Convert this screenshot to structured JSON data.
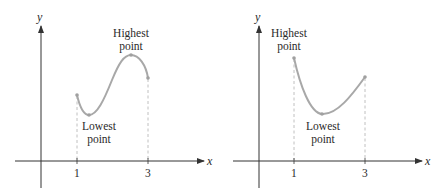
{
  "colors": {
    "axis": "#333333",
    "curve": "#a8a8a8",
    "dashed": "#b0b0b0",
    "text": "#2a2a2a",
    "background": "#ffffff"
  },
  "left_graph": {
    "y_axis_label": "y",
    "x_axis_label": "x",
    "tick_1": "1",
    "tick_3": "3",
    "highest_label_line1": "Highest",
    "highest_label_line2": "point",
    "lowest_label_line1": "Lowest",
    "lowest_label_line2": "point"
  },
  "right_graph": {
    "y_axis_label": "y",
    "x_axis_label": "x",
    "tick_1": "1",
    "tick_3": "3",
    "highest_label_line1": "Highest",
    "highest_label_line2": "point",
    "lowest_label_line1": "Lowest",
    "lowest_label_line2": "point"
  }
}
